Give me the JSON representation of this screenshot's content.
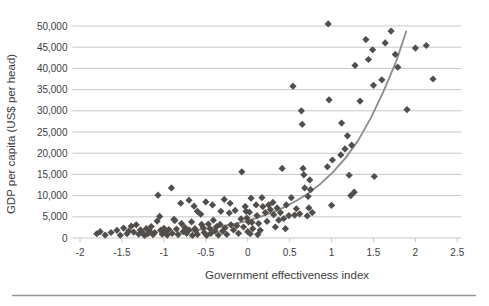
{
  "chart_data": {
    "type": "scatter",
    "title": "",
    "xlabel": "Government effectiveness index",
    "ylabel": "GDP per capita (US$ per head)",
    "xlim": [
      -2.09,
      2.55
    ],
    "ylim": [
      0,
      50000
    ],
    "grid": "horizontal-only",
    "legend": "none",
    "marker": "diamond",
    "marker_color": "#514e4b",
    "trend_color": "#8c8c8c",
    "gridline_color": "#c7c7c7",
    "tick_text_color": "#3d3d3d",
    "separator_color": "#979797",
    "x_ticks": [
      -2,
      -1.5,
      -1,
      -0.5,
      0,
      0.5,
      1,
      1.5,
      2,
      2.5
    ],
    "x_tick_labels": [
      "-2",
      "-1.5",
      "-1",
      "-0.5",
      "0",
      "0.5",
      "1",
      "1.5",
      "2",
      "2.5"
    ],
    "y_ticks": [
      0,
      5000,
      10000,
      15000,
      20000,
      25000,
      30000,
      35000,
      40000,
      45000,
      50000
    ],
    "y_tick_labels": [
      "0",
      "5,000",
      "10,000",
      "15,000",
      "20,000",
      "25,000",
      "30,000",
      "35,000",
      "40,000",
      "45,000",
      "50,000"
    ],
    "points": [
      [
        -1.8,
        1000
      ],
      [
        -1.76,
        1500
      ],
      [
        -1.7,
        700
      ],
      [
        -1.63,
        1300
      ],
      [
        -1.56,
        1800
      ],
      [
        -1.52,
        650
      ],
      [
        -1.48,
        2350
      ],
      [
        -1.44,
        1000
      ],
      [
        -1.42,
        1650
      ],
      [
        -1.39,
        2800
      ],
      [
        -1.36,
        1400
      ],
      [
        -1.33,
        3100
      ],
      [
        -1.3,
        900
      ],
      [
        -1.28,
        1900
      ],
      [
        -1.26,
        1400
      ],
      [
        -1.23,
        600
      ],
      [
        -1.21,
        2200
      ],
      [
        -1.19,
        1000
      ],
      [
        -1.17,
        1600
      ],
      [
        -1.15,
        2700
      ],
      [
        -1.13,
        800
      ],
      [
        -1.11,
        1300
      ],
      [
        -1.08,
        4000
      ],
      [
        -1.07,
        10100
      ],
      [
        -1.05,
        5100
      ],
      [
        -1.04,
        1800
      ],
      [
        -1.02,
        900
      ],
      [
        -1.0,
        2300
      ],
      [
        -0.98,
        1400
      ],
      [
        -0.96,
        700
      ],
      [
        -0.94,
        2000
      ],
      [
        -0.91,
        11800
      ],
      [
        -0.9,
        1100
      ],
      [
        -0.88,
        4400
      ],
      [
        -0.87,
        4100
      ],
      [
        -0.85,
        2100
      ],
      [
        -0.83,
        800
      ],
      [
        -0.8,
        8200
      ],
      [
        -0.79,
        3400
      ],
      [
        -0.77,
        1500
      ],
      [
        -0.75,
        2500
      ],
      [
        -0.73,
        1100
      ],
      [
        -0.7,
        8900
      ],
      [
        -0.7,
        1900
      ],
      [
        -0.67,
        3800
      ],
      [
        -0.66,
        600
      ],
      [
        -0.64,
        7500
      ],
      [
        -0.63,
        2200
      ],
      [
        -0.62,
        1700
      ],
      [
        -0.6,
        6300
      ],
      [
        -0.6,
        850
      ],
      [
        -0.56,
        5600
      ],
      [
        -0.55,
        3200
      ],
      [
        -0.53,
        2400
      ],
      [
        -0.52,
        1300
      ],
      [
        -0.5,
        8500
      ],
      [
        -0.49,
        600
      ],
      [
        -0.47,
        3300
      ],
      [
        -0.45,
        2200
      ],
      [
        -0.44,
        1100
      ],
      [
        -0.42,
        7800
      ],
      [
        -0.41,
        4200
      ],
      [
        -0.39,
        1700
      ],
      [
        -0.37,
        2700
      ],
      [
        -0.35,
        700
      ],
      [
        -0.33,
        3200
      ],
      [
        -0.32,
        6300
      ],
      [
        -0.3,
        1600
      ],
      [
        -0.28,
        9100
      ],
      [
        -0.27,
        2400
      ],
      [
        -0.25,
        850
      ],
      [
        -0.22,
        5900
      ],
      [
        -0.21,
        8200
      ],
      [
        -0.2,
        3100
      ],
      [
        -0.17,
        1900
      ],
      [
        -0.15,
        6500
      ],
      [
        -0.13,
        2900
      ],
      [
        -0.11,
        1100
      ],
      [
        -0.08,
        4500
      ],
      [
        -0.07,
        15600
      ],
      [
        -0.05,
        2600
      ],
      [
        -0.03,
        7400
      ],
      [
        -0.02,
        6300
      ],
      [
        -0.01,
        4700
      ],
      [
        0.0,
        1500
      ],
      [
        0.01,
        3800
      ],
      [
        0.02,
        6100
      ],
      [
        0.03,
        1000
      ],
      [
        0.04,
        9400
      ],
      [
        0.05,
        3700
      ],
      [
        0.06,
        2200
      ],
      [
        0.1,
        7800
      ],
      [
        0.11,
        5300
      ],
      [
        0.12,
        800
      ],
      [
        0.13,
        3400
      ],
      [
        0.15,
        1800
      ],
      [
        0.17,
        9500
      ],
      [
        0.18,
        7400
      ],
      [
        0.21,
        6000
      ],
      [
        0.23,
        3900
      ],
      [
        0.25,
        7800
      ],
      [
        0.27,
        6700
      ],
      [
        0.3,
        8400
      ],
      [
        0.31,
        5500
      ],
      [
        0.33,
        2600
      ],
      [
        0.35,
        7100
      ],
      [
        0.37,
        4200
      ],
      [
        0.39,
        6000
      ],
      [
        0.41,
        16400
      ],
      [
        0.43,
        4600
      ],
      [
        0.45,
        2200
      ],
      [
        0.46,
        7800
      ],
      [
        0.49,
        5300
      ],
      [
        0.52,
        9500
      ],
      [
        0.54,
        35800
      ],
      [
        0.56,
        5400
      ],
      [
        0.58,
        6900
      ],
      [
        0.62,
        5700
      ],
      [
        0.64,
        30000
      ],
      [
        0.65,
        26800
      ],
      [
        0.66,
        16400
      ],
      [
        0.67,
        14900
      ],
      [
        0.68,
        11800
      ],
      [
        0.71,
        5200
      ],
      [
        0.72,
        9800
      ],
      [
        0.73,
        7100
      ],
      [
        0.74,
        13700
      ],
      [
        0.75,
        11400
      ],
      [
        0.77,
        6000
      ],
      [
        0.95,
        16800
      ],
      [
        0.96,
        50500
      ],
      [
        0.97,
        32600
      ],
      [
        1.0,
        7700
      ],
      [
        1.01,
        18400
      ],
      [
        1.11,
        19600
      ],
      [
        1.12,
        27100
      ],
      [
        1.16,
        21000
      ],
      [
        1.19,
        24100
      ],
      [
        1.21,
        14800
      ],
      [
        1.23,
        10000
      ],
      [
        1.24,
        21900
      ],
      [
        1.27,
        10800
      ],
      [
        1.28,
        40700
      ],
      [
        1.34,
        32300
      ],
      [
        1.41,
        46800
      ],
      [
        1.44,
        42100
      ],
      [
        1.49,
        44400
      ],
      [
        1.5,
        36000
      ],
      [
        1.51,
        14500
      ],
      [
        1.6,
        37300
      ],
      [
        1.64,
        46000
      ],
      [
        1.71,
        48800
      ],
      [
        1.76,
        43300
      ],
      [
        1.79,
        40300
      ],
      [
        1.9,
        30300
      ],
      [
        2.0,
        44800
      ],
      [
        2.13,
        45400
      ],
      [
        2.21,
        37500
      ]
    ],
    "trendline": [
      [
        -0.78,
        1480
      ],
      [
        -0.63,
        1800
      ],
      [
        -0.48,
        2190
      ],
      [
        -0.33,
        2670
      ],
      [
        -0.18,
        3240
      ],
      [
        -0.03,
        3940
      ],
      [
        0.12,
        4800
      ],
      [
        0.27,
        5840
      ],
      [
        0.42,
        7110
      ],
      [
        0.57,
        8650
      ],
      [
        0.72,
        10520
      ],
      [
        0.87,
        12810
      ],
      [
        1.02,
        15590
      ],
      [
        1.17,
        18970
      ],
      [
        1.32,
        23080
      ],
      [
        1.47,
        28400
      ],
      [
        1.62,
        34600
      ],
      [
        1.77,
        41600
      ],
      [
        1.89,
        48700
      ]
    ]
  }
}
